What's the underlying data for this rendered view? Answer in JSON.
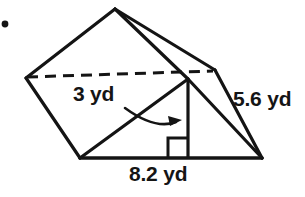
{
  "figure": {
    "type": "triangular-prism-geometry-diagram",
    "bullet": "•",
    "background_color": "#ffffff",
    "stroke_color": "#141414",
    "labels": {
      "slant_height": "3 yd",
      "lateral_edge": "5.6 yd",
      "base": "8.2 yd"
    },
    "icons": {
      "arrow": "curved-arrow-icon",
      "right_angle": "right-angle-marker-icon",
      "bullet": "bullet-point-icon"
    },
    "geometry": {
      "apex_top": [
        115,
        9
      ],
      "left_vertex": [
        26,
        78
      ],
      "rear_right_vertex": [
        215,
        70
      ],
      "front_apex": [
        188,
        79
      ],
      "bottom_left_vertex": [
        80,
        158
      ],
      "bottom_right_vertex": [
        262,
        158
      ],
      "dashed_line": [
        [
          27,
          77
        ],
        [
          213,
          71
        ]
      ],
      "height_line": [
        [
          188,
          79
        ],
        [
          188,
          158
        ]
      ],
      "right_angle_square": [
        168,
        138,
        20,
        20
      ]
    }
  }
}
